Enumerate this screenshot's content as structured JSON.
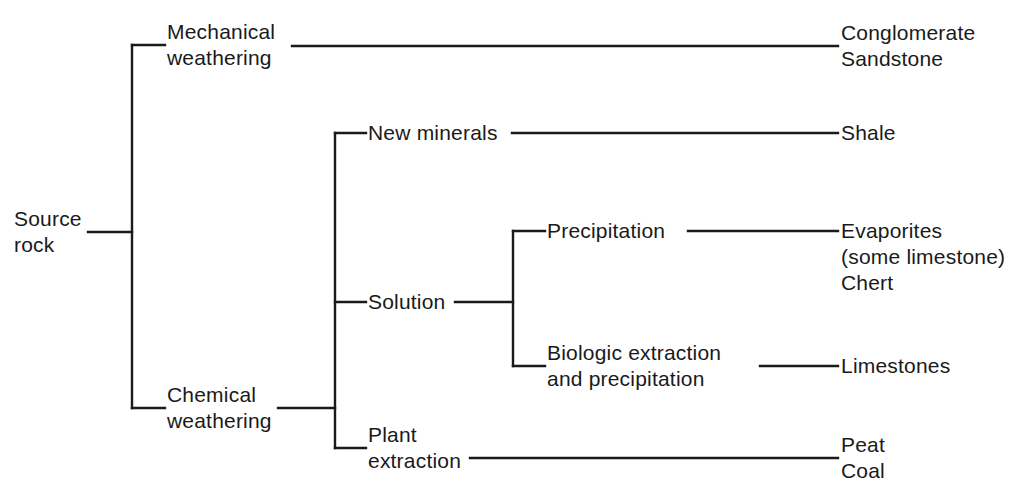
{
  "diagram": {
    "type": "tree",
    "orientation": "left-to-right",
    "colors": {
      "line": "#1a1a1a",
      "text": "#1a1a1a",
      "background": "#ffffff"
    },
    "root": {
      "label_line1": "Source",
      "label_line2": "rock"
    },
    "nodes": {
      "mechanical_weathering": {
        "line1": "Mechanical",
        "line2": "weathering"
      },
      "chemical_weathering": {
        "line1": "Chemical",
        "line2": "weathering"
      },
      "new_minerals": {
        "line1": "New minerals"
      },
      "solution": {
        "line1": "Solution"
      },
      "plant_extraction": {
        "line1": "Plant",
        "line2": "extraction"
      },
      "precipitation": {
        "line1": "Precipitation"
      },
      "biologic_extraction": {
        "line1": "Biologic extraction",
        "line2": "and precipitation"
      }
    },
    "products": {
      "clastics": {
        "line1": "Conglomerate",
        "line2": "Sandstone"
      },
      "shale": {
        "line1": "Shale"
      },
      "evaporites": {
        "line1": "Evaporites",
        "line2": "(some limestone)",
        "line3": "Chert"
      },
      "limestones": {
        "line1": "Limestones"
      },
      "organics": {
        "line1": "Peat",
        "line2": "Coal"
      }
    },
    "edges": [
      {
        "from": "source_rock",
        "to": "mechanical_weathering"
      },
      {
        "from": "source_rock",
        "to": "chemical_weathering"
      },
      {
        "from": "mechanical_weathering",
        "to": "clastics"
      },
      {
        "from": "chemical_weathering",
        "to": "new_minerals"
      },
      {
        "from": "chemical_weathering",
        "to": "solution"
      },
      {
        "from": "chemical_weathering",
        "to": "plant_extraction"
      },
      {
        "from": "new_minerals",
        "to": "shale"
      },
      {
        "from": "solution",
        "to": "precipitation"
      },
      {
        "from": "solution",
        "to": "biologic_extraction"
      },
      {
        "from": "precipitation",
        "to": "evaporites"
      },
      {
        "from": "biologic_extraction",
        "to": "limestones"
      },
      {
        "from": "plant_extraction",
        "to": "organics"
      }
    ]
  }
}
